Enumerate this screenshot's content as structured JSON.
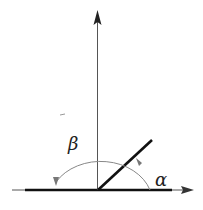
{
  "diagram": {
    "type": "angle-diagram",
    "labels": {
      "alpha": "α",
      "beta": "β"
    },
    "colors": {
      "axis": "#555555",
      "thick_line": "#111111",
      "arc": "#888888",
      "text": "#222222"
    },
    "elements": {
      "horizontal_axis": "horizontal axis with arrow pointing right",
      "vertical_axis": "vertical axis with arrow pointing up",
      "ray": "thick ray at angle alpha from horizontal",
      "arc_alpha": "arc from horizontal axis to ray, labeled alpha",
      "arc_beta": "arc from ray to negative horizontal axis, labeled beta"
    }
  }
}
